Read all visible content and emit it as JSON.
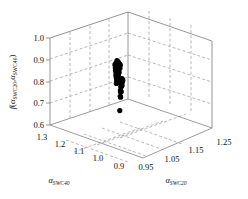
{
  "chart_data": {
    "type": "scatter",
    "projection": "3d",
    "title": "",
    "xlabel": "α_SWC20",
    "ylabel": "α_SWC40",
    "zlabel": "f(α_SWC20, α_SWC40)",
    "axes": {
      "x": {
        "label_base": "α",
        "label_sub": "SWC20",
        "ticks": [
          "0.95",
          "1.05",
          "1.15",
          "1.25"
        ],
        "values": [
          0.95,
          1.05,
          1.15,
          1.25
        ],
        "lim": [
          0.9,
          1.3
        ],
        "grid": true
      },
      "y": {
        "label_base": "α",
        "label_sub": "SWC40",
        "ticks": [
          "1.3",
          "1.2",
          "1.1",
          "1.0",
          "0.9"
        ],
        "values": [
          1.3,
          1.2,
          1.1,
          1.0,
          0.9
        ],
        "lim": [
          0.9,
          1.3
        ],
        "grid": true
      },
      "z": {
        "label_f": "f",
        "label_open": "(",
        "label_a1": "α",
        "label_a1_sub": "SWC20",
        "label_comma": ",",
        "label_a2": "α",
        "label_a2_sub": "SWC40",
        "label_close": ")",
        "ticks": [
          "1.0",
          "0.9",
          "0.8",
          "0.7",
          "0.6"
        ],
        "values": [
          1.0,
          0.9,
          0.8,
          0.7,
          0.6
        ],
        "lim": [
          0.6,
          1.0
        ],
        "grid": true
      }
    },
    "legend": null,
    "grid_style": "dashed",
    "marker_color": "#000000",
    "series": [
      {
        "name": "solution cloud",
        "marker": "filled-circle",
        "description": "dense black cluster of near-optimal points with a sparse tail of isolated points below",
        "points": [
          [
            1.06,
            1.13,
            0.905
          ],
          [
            1.062,
            1.128,
            0.9
          ],
          [
            1.058,
            1.131,
            0.898
          ],
          [
            1.064,
            1.126,
            0.895
          ],
          [
            1.056,
            1.133,
            0.893
          ],
          [
            1.066,
            1.124,
            0.891
          ],
          [
            1.06,
            1.13,
            0.889
          ],
          [
            1.054,
            1.135,
            0.887
          ],
          [
            1.068,
            1.122,
            0.885
          ],
          [
            1.061,
            1.129,
            0.883
          ],
          [
            1.057,
            1.132,
            0.881
          ],
          [
            1.065,
            1.125,
            0.879
          ],
          [
            1.059,
            1.131,
            0.877
          ],
          [
            1.063,
            1.127,
            0.875
          ],
          [
            1.055,
            1.134,
            0.873
          ],
          [
            1.067,
            1.123,
            0.871
          ],
          [
            1.06,
            1.13,
            0.869
          ],
          [
            1.062,
            1.128,
            0.867
          ],
          [
            1.058,
            1.132,
            0.865
          ],
          [
            1.064,
            1.126,
            0.863
          ],
          [
            1.056,
            1.134,
            0.861
          ],
          [
            1.061,
            1.129,
            0.859
          ],
          [
            1.059,
            1.131,
            0.857
          ],
          [
            1.063,
            1.127,
            0.855
          ],
          [
            1.057,
            1.133,
            0.853
          ],
          [
            1.065,
            1.125,
            0.851
          ],
          [
            1.06,
            1.13,
            0.849
          ],
          [
            1.062,
            1.128,
            0.847
          ],
          [
            1.058,
            1.132,
            0.845
          ],
          [
            1.061,
            1.129,
            0.843
          ],
          [
            1.059,
            1.131,
            0.841
          ],
          [
            1.063,
            1.127,
            0.839
          ],
          [
            1.057,
            1.133,
            0.837
          ],
          [
            1.06,
            1.13,
            0.835
          ],
          [
            1.062,
            1.128,
            0.833
          ],
          [
            1.059,
            1.131,
            0.831
          ],
          [
            1.061,
            1.129,
            0.829
          ],
          [
            1.058,
            1.132,
            0.827
          ],
          [
            1.06,
            1.13,
            0.825
          ],
          [
            1.072,
            1.118,
            0.823
          ],
          [
            1.07,
            1.12,
            0.819
          ],
          [
            1.074,
            1.116,
            0.815
          ],
          [
            1.071,
            1.119,
            0.811
          ],
          [
            1.073,
            1.117,
            0.807
          ],
          [
            1.06,
            1.13,
            0.82
          ],
          [
            1.059,
            1.131,
            0.815
          ],
          [
            1.061,
            1.129,
            0.81
          ],
          [
            1.06,
            1.13,
            0.805
          ],
          [
            1.058,
            1.132,
            0.8
          ],
          [
            1.07,
            1.12,
            0.796
          ],
          [
            1.072,
            1.118,
            0.792
          ],
          [
            1.071,
            1.119,
            0.788
          ],
          [
            1.069,
            1.121,
            0.784
          ],
          [
            1.068,
            1.122,
            0.768
          ],
          [
            1.07,
            1.12,
            0.764
          ],
          [
            1.069,
            1.121,
            0.76
          ],
          [
            1.067,
            1.122,
            0.742
          ],
          [
            1.068,
            1.121,
            0.738
          ],
          [
            1.066,
            1.123,
            0.676
          ]
        ]
      }
    ]
  },
  "figure": {
    "background": "#ffffff",
    "axis_line_color": "#8a8a8a",
    "grid_color": "#9a9a9a",
    "text_color": "#111111"
  }
}
